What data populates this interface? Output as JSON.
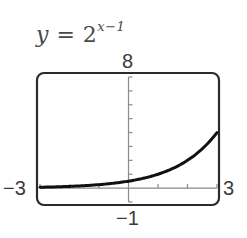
{
  "equation": {
    "lhs": "y",
    "equals": " = ",
    "base": "2",
    "exponent": "x−1"
  },
  "window": {
    "xmin_label": "−3",
    "xmax_label": "3",
    "ymin_label": "−1",
    "ymax_label": "8"
  },
  "colors": {
    "frame": "#2b2b2b",
    "axis": "#8a8a8a",
    "curve": "#111111",
    "text": "#3a3a3a"
  },
  "chart_data": {
    "type": "line",
    "function": "2^(x-1)",
    "xlabel": "",
    "ylabel": "",
    "xlim": [
      -3,
      3
    ],
    "ylim": [
      -1,
      8
    ],
    "xscl": 1,
    "yscl": 1,
    "grid": false,
    "legend": "none",
    "tick_labels": {
      "xmin": "-3",
      "xmax": "3",
      "ymin": "-1",
      "ymax": "8"
    },
    "series": [
      {
        "name": "y = 2^(x-1)",
        "x": [
          -3,
          -2.5,
          -2,
          -1.5,
          -1,
          -0.5,
          0,
          0.5,
          1,
          1.5,
          2,
          2.5,
          3
        ],
        "y": [
          0.0625,
          0.0884,
          0.125,
          0.1768,
          0.25,
          0.3536,
          0.5,
          0.7071,
          1,
          1.4142,
          2,
          2.8284,
          4
        ]
      }
    ]
  }
}
